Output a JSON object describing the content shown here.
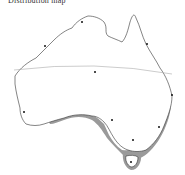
{
  "map": {
    "title": "Distribution map",
    "region": "Australia",
    "colors": {
      "outline": "#333333",
      "distribution": "#9a9a9a",
      "tropic_line": "#aaaaaa",
      "city_marker": "#111111",
      "background": "#ffffff"
    },
    "features": {
      "tropic_line": "Tropic of Capricorn",
      "distribution_area": "South-eastern coastal Australia and Tasmania",
      "city_markers": 10
    }
  }
}
